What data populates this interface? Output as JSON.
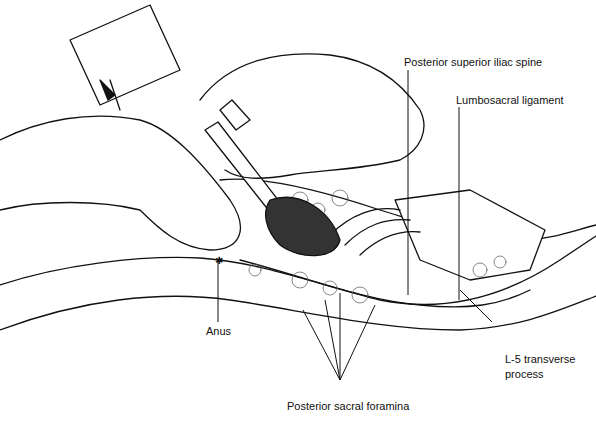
{
  "figure": {
    "labels": {
      "psis": "Posterior superior iliac spine",
      "lumbosacral": "Lumbosacral ligament",
      "anus": "Anus",
      "l5_line1": "L-5 transverse",
      "l5_line2": "process",
      "foramina": "Posterior sacral foramina"
    },
    "colors": {
      "ink": "#111111",
      "background": "#ffffff",
      "shade": "#cfcfcf"
    }
  }
}
